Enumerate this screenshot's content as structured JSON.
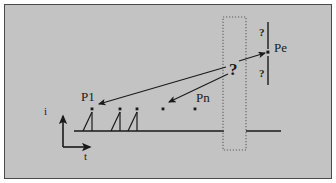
{
  "figure": {
    "background_color": "#c3c3c3",
    "page_color": "#ffffff",
    "border_color": "#4a4a4a",
    "ink_color": "#1a1a1a",
    "dotted_color": "#707070"
  },
  "axes": {
    "y_label": "i",
    "x_label": "t",
    "y_label_pos": {
      "x": 46,
      "y": 107
    },
    "x_label_pos": {
      "x": 85,
      "y": 152
    },
    "origin": {
      "x": 63,
      "y": 147
    },
    "y_arrow_top": {
      "x": 63,
      "y": 112
    },
    "x_arrow_right": {
      "x": 94,
      "y": 147
    }
  },
  "baselines": [
    {
      "name": "observed-baseline",
      "x1": 74,
      "y1": 131,
      "x2": 224,
      "y2": 131
    },
    {
      "name": "predicted-baseline",
      "x1": 246,
      "y1": 131,
      "x2": 281,
      "y2": 131
    }
  ],
  "pulses": [
    {
      "name": "pulse-1",
      "x": 92,
      "top_y": 109,
      "base_y": 131,
      "has_spike": true,
      "dot": true
    },
    {
      "name": "pulse-2",
      "x": 120,
      "top_y": 109,
      "base_y": 131,
      "has_spike": true,
      "dot": true
    },
    {
      "name": "pulse-3",
      "x": 137,
      "top_y": 109,
      "base_y": 131,
      "has_spike": true,
      "dot": true
    },
    {
      "name": "pulse-4",
      "x": 163,
      "top_y": 109,
      "base_y": 131,
      "has_spike": false,
      "dot": true
    },
    {
      "name": "pulse-5",
      "x": 195,
      "top_y": 109,
      "base_y": 131,
      "has_spike": false,
      "dot": true
    }
  ],
  "pulse_labels": [
    {
      "name": "label-p1",
      "text": "P1",
      "x": 81,
      "y": 92
    },
    {
      "name": "label-pn",
      "text": "Pn",
      "x": 196,
      "y": 93
    }
  ],
  "unknown_marker": {
    "name": "unknown-question-mark",
    "text": "?",
    "x": 230,
    "y": 62
  },
  "uncertainty_marks": [
    {
      "name": "uncertainty-above",
      "text": "?",
      "x": 260,
      "y": 27
    },
    {
      "name": "uncertainty-below",
      "text": "?",
      "x": 260,
      "y": 70
    }
  ],
  "predicted_pulse": {
    "name": "predicted-pulse-pe",
    "label": "Pe",
    "label_x": 275,
    "label_y": 42,
    "dot_x": 268,
    "dot_y": 52,
    "error_bar_x": 268,
    "error_bar_top": 22,
    "error_bar_bottom": 85
  },
  "arrows": [
    {
      "name": "arrow-to-p1",
      "from": {
        "x": 226,
        "y": 68
      },
      "to": {
        "x": 96,
        "y": 105
      }
    },
    {
      "name": "arrow-to-pulse-4",
      "from": {
        "x": 228,
        "y": 74
      },
      "to": {
        "x": 166,
        "y": 103
      }
    },
    {
      "name": "arrow-to-pe",
      "from": {
        "x": 240,
        "y": 62
      },
      "to": {
        "x": 266,
        "y": 53
      }
    }
  ],
  "prediction_region": {
    "name": "prediction-region-box",
    "x": 223,
    "y": 17,
    "width": 23,
    "height": 133,
    "style": "dotted"
  }
}
